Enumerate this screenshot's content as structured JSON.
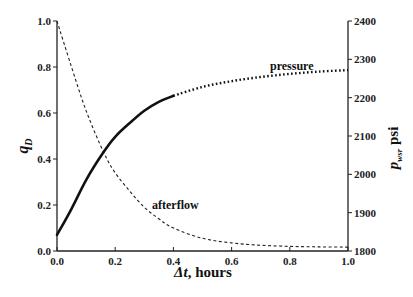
{
  "chart_data": {
    "type": "line",
    "title": "",
    "xlabel": "Δt, hours",
    "ylabel_left": "qD",
    "ylabel_right": "pws, psi",
    "xlim": [
      0.0,
      1.0
    ],
    "ylim_left": [
      0.0,
      1.0
    ],
    "ylim_right": [
      1800,
      2400
    ],
    "x_ticks": [
      "0.0",
      "0.2",
      "0.4",
      "0.6",
      "0.8",
      "1.0"
    ],
    "y_ticks_left": [
      "0.0",
      "0.2",
      "0.4",
      "0.6",
      "0.8",
      "1.0"
    ],
    "y_ticks_right": [
      "1800",
      "1900",
      "2000",
      "2100",
      "2200",
      "2300",
      "2400"
    ],
    "grid": false,
    "legend": "none (inline annotations)",
    "annotations": [
      "pressure",
      "afterflow"
    ],
    "series": [
      {
        "name": "afterflow",
        "axis": "left",
        "style": "dashed",
        "x": [
          0.0,
          0.05,
          0.1,
          0.16,
          0.2,
          0.25,
          0.3,
          0.35,
          0.4,
          0.5,
          0.6,
          0.7,
          0.8,
          0.9,
          1.0
        ],
        "values": [
          1.0,
          0.8,
          0.61,
          0.43,
          0.34,
          0.26,
          0.19,
          0.14,
          0.1,
          0.055,
          0.035,
          0.025,
          0.02,
          0.018,
          0.017
        ]
      },
      {
        "name": "pressure",
        "axis": "right",
        "style": "solid then dotted",
        "x": [
          0.0,
          0.05,
          0.1,
          0.16,
          0.2,
          0.25,
          0.3,
          0.35,
          0.4,
          0.5,
          0.6,
          0.7,
          0.8,
          0.9,
          1.0
        ],
        "values": [
          1842,
          1910,
          1985,
          2058,
          2098,
          2134,
          2166,
          2189,
          2205,
          2228,
          2243,
          2254,
          2262,
          2268,
          2272
        ]
      }
    ]
  },
  "labels": {
    "xlabel_main": "Δt",
    "xlabel_rest": ", hours",
    "ylabel_left_main": "q",
    "ylabel_left_sub": "D",
    "ylabel_right_main": "p",
    "ylabel_right_sub": "wsr",
    "ylabel_right_unit": " psi",
    "annot_pressure": "pressure",
    "annot_afterflow": "afterflow"
  }
}
